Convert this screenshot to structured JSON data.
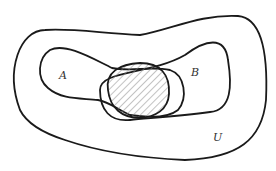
{
  "diagram": {
    "type": "venn",
    "title": "",
    "sets": [
      {
        "id": "U",
        "label": "U",
        "role": "universal set"
      },
      {
        "id": "A",
        "label": "A",
        "role": "set"
      },
      {
        "id": "B",
        "label": "B",
        "role": "set"
      }
    ],
    "shaded_region": "A ∩ B",
    "colors": {
      "stroke": "#1a1a1a",
      "hatch": "#888888",
      "background": "#ffffff",
      "label": "#333333"
    }
  }
}
